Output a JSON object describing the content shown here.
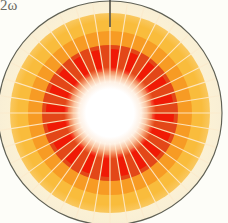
{
  "figure": {
    "background_color": "#fdfdf8",
    "corner_label": "2ω",
    "outline_color": "#5f6054",
    "center_x": 110,
    "center_y": 113,
    "needle": {
      "color": "#3a3a34",
      "x": 110,
      "y_top": 0,
      "y_bottom": 27,
      "width": 1.4
    }
  },
  "chart_data": {
    "type": "pie",
    "title": "2ω",
    "subtitle": "",
    "xlabel": "",
    "ylabel": "",
    "grid": false,
    "legend_position": "none",
    "center": [
      110,
      113
    ],
    "outer_radius": 112,
    "angle_offset_deg": -90,
    "sector_count": 40,
    "sector_width_deg": 9,
    "rings": [
      {
        "name": "outer-rim-cream",
        "r_inner": 100,
        "r_outer": 112,
        "color": "#fbf0d2",
        "label": "outer cream rim"
      },
      {
        "name": "amber-band",
        "r_inner": 82,
        "r_outer": 100,
        "color": "#f9bc3c",
        "label": "amber annulus"
      },
      {
        "name": "orange-band",
        "r_inner": 68,
        "r_outer": 82,
        "color": "#f79b24",
        "label": "orange annulus"
      },
      {
        "name": "red-orange-band",
        "r_inner": 38,
        "r_outer": 68,
        "color": "#e34718",
        "label": "red-orange annulus"
      },
      {
        "name": "bright-red-segments",
        "r_inner": 42,
        "r_outer": 64,
        "color": "#f01a06",
        "label": "bright red alternating blocks"
      }
    ],
    "core": {
      "name": "white-hot-core",
      "radius": 38,
      "glow_radius": 46,
      "color": "#ffffff",
      "label": "white glowing center"
    },
    "spokes": {
      "count": 40,
      "color": "#fde7c4",
      "width": 1.1,
      "r_inner": 30,
      "r_outer": 112
    },
    "categories": [
      "0",
      "9",
      "18",
      "27",
      "36",
      "45",
      "54",
      "63",
      "72",
      "81",
      "90",
      "99",
      "108",
      "117",
      "126",
      "135",
      "144",
      "153",
      "162",
      "171",
      "180",
      "189",
      "198",
      "207",
      "216",
      "225",
      "234",
      "243",
      "252",
      "261",
      "270",
      "279",
      "288",
      "297",
      "306",
      "315",
      "324",
      "333",
      "342",
      "351"
    ],
    "values": [
      64,
      52,
      64,
      52,
      64,
      52,
      64,
      52,
      64,
      52,
      64,
      52,
      64,
      52,
      64,
      52,
      64,
      52,
      64,
      52,
      64,
      52,
      64,
      52,
      64,
      52,
      64,
      52,
      64,
      52,
      64,
      52,
      64,
      52,
      64,
      52,
      64,
      52,
      64,
      52
    ],
    "ylim": [
      0,
      112
    ]
  }
}
